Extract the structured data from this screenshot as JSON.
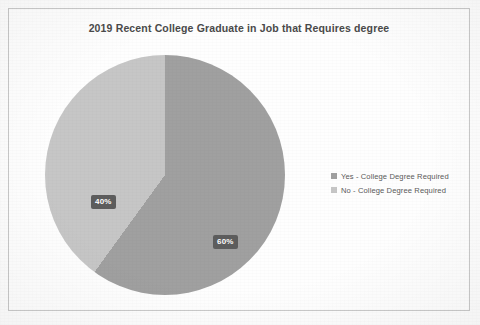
{
  "chart_data": {
    "type": "pie",
    "title": "2019 Recent College Graduate in Job that Requires degree",
    "xlabel": "",
    "ylabel": "",
    "legend_position": "right",
    "grid": false,
    "start_angle_deg": 0,
    "direction": "clockwise",
    "categories": [
      "Yes - College Degree Required",
      "No - College Degree Required"
    ],
    "values": [
      60,
      40
    ],
    "data_labels": [
      "60%",
      "40%"
    ],
    "colors": [
      "#a0a0a0",
      "#c6c6c6"
    ],
    "slices": [
      {
        "name": "Yes - College Degree Required",
        "value": 60,
        "label": "60%",
        "color": "#a0a0a0"
      },
      {
        "name": "No - College Degree Required",
        "value": 40,
        "label": "40%",
        "color": "#c6c6c6"
      }
    ]
  },
  "chart": {
    "title": "2019 Recent College Graduate in Job that Requires degree",
    "label_yes": "60%",
    "label_no": "40%"
  },
  "legend": {
    "items": [
      {
        "label": "Yes - College Degree Required",
        "color": "#a0a0a0"
      },
      {
        "label": "No - College Degree Required",
        "color": "#c6c6c6"
      }
    ]
  },
  "colors": {
    "slice_yes": "#a0a0a0",
    "slice_no": "#c6c6c6",
    "label_box": "#5d5d5d",
    "label_text": "#ffffff",
    "title_text": "#4a4a4a",
    "frame_border": "#c9c9c9",
    "page_background": "#fdfdfd"
  }
}
